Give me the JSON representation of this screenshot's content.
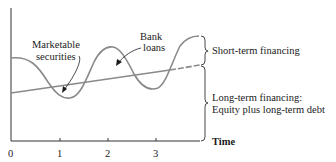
{
  "diagram": {
    "type": "financing-needs-over-time",
    "curves": {
      "total_assets_wave": "Cyclical total financing requirement",
      "long_term_trend": "Long-term financing trend line"
    },
    "annotations": {
      "marketable_securities": [
        "Marketable",
        "securities"
      ],
      "bank_loans": [
        "Bank",
        "loans"
      ]
    },
    "brace_labels": {
      "short_term": "Short-term financing",
      "long_term_line1": "Long-term financing:",
      "long_term_line2": "Equity plus long-term debt"
    },
    "x_axis": {
      "label": "Time",
      "ticks": [
        "0",
        "1",
        "2",
        "3"
      ]
    },
    "colors": {
      "axis": "#333333",
      "curve": "#8a8a8a",
      "text": "#1a1a1a"
    }
  }
}
